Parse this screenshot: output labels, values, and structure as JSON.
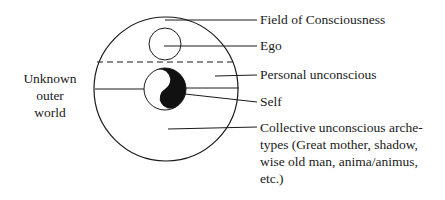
{
  "diagram": {
    "left_label": [
      "Unknown",
      "outer",
      "world"
    ],
    "labels": {
      "field_of_consciousness": "Field of Consciousness",
      "ego": "Ego",
      "personal_unconscious": "Personal unconscious",
      "self": "Self",
      "collective_unconscious": [
        "Collective unconscious arche-",
        "types (Great mother, shadow,",
        "wise old man, anima/animus,",
        "etc.)"
      ]
    },
    "colors": {
      "line": "#1a1a1a",
      "fill_dark": "#111111",
      "background": "#ffffff"
    }
  }
}
